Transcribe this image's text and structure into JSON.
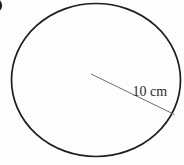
{
  "figure": {
    "radius_label": "10 cm",
    "radius_value": "10",
    "radius_unit": "cm",
    "colors": {
      "background": "#fdfdfd",
      "circle_stroke": "#1d1d1d",
      "radius_line": "#6f6f6f",
      "label_text": "#2e2a28"
    }
  }
}
